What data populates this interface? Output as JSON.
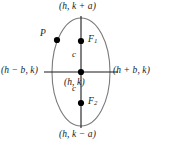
{
  "figure": {
    "kind": "vertical-ellipse-diagram",
    "colors": {
      "background": "#ffffff",
      "ellipse_stroke": "#7a7a7a",
      "axis_stroke": "#1a1a1a",
      "point_fill": "#000000",
      "text": "#1a1a1a"
    },
    "labels": {
      "top_vertex": "(h, k + a)",
      "bottom_vertex": "(h, k − a)",
      "left_covertex": "(h − b, k)",
      "right_covertex": "(h + b, k)",
      "center": "(h, k)",
      "focus_upper_base": "F",
      "focus_upper_sub": "1",
      "focus_lower_base": "F",
      "focus_lower_sub": "2",
      "c_upper": "c",
      "c_lower": "c",
      "point_on_ellipse": "P"
    },
    "geometry": {
      "center_x": 81,
      "center_y": 72,
      "semi_axis_x": 29,
      "semi_axis_y": 54,
      "focus_upper_x": 81,
      "focus_upper_y": 41,
      "focus_lower_x": 81,
      "focus_lower_y": 103,
      "point_p_x": 57,
      "point_p_y": 40,
      "point_radius": 3.1,
      "major_axis_top_y": 16,
      "major_axis_bottom_y": 128,
      "minor_axis_left_x": 44,
      "minor_axis_right_x": 118
    }
  }
}
